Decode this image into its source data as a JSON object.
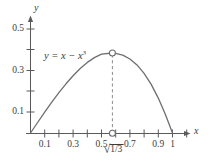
{
  "chart_data": {
    "type": "line",
    "title": "",
    "curve_label": "y = x − x³",
    "function": "y = x - x^3",
    "xlabel": "x",
    "ylabel": "y",
    "xlim": [
      -0.05,
      1.12
    ],
    "ylim": [
      -0.03,
      0.57
    ],
    "grid": false,
    "legend_position": "none",
    "x_ticks": [
      0.1,
      0.2,
      0.3,
      0.4,
      0.5,
      0.6,
      0.7,
      0.8,
      0.9,
      1.0,
      1.1
    ],
    "x_tick_labels": [
      {
        "value": 0.1,
        "label": "0.1"
      },
      {
        "value": 0.3,
        "label": "0.3"
      },
      {
        "value": 0.5,
        "label": "0.5"
      },
      {
        "value": 0.7,
        "label": "0.7"
      },
      {
        "value": 0.9,
        "label": "0.9"
      },
      {
        "value": 1.0,
        "label": "1"
      }
    ],
    "y_ticks": [
      0.1,
      0.2,
      0.3,
      0.4,
      0.5
    ],
    "y_tick_labels": [
      {
        "value": 0.1,
        "label": "0.1"
      },
      {
        "value": 0.3,
        "label": "0.3"
      },
      {
        "value": 0.5,
        "label": "0.5"
      }
    ],
    "x": [
      0.0,
      0.05,
      0.1,
      0.15,
      0.2,
      0.25,
      0.3,
      0.35,
      0.4,
      0.45,
      0.5,
      0.5774,
      0.6,
      0.65,
      0.7,
      0.75,
      0.8,
      0.85,
      0.9,
      0.95,
      1.0
    ],
    "y": [
      0.0,
      0.0499,
      0.099,
      0.1466,
      0.192,
      0.2344,
      0.273,
      0.3071,
      0.336,
      0.3589,
      0.375,
      0.3849,
      0.384,
      0.3754,
      0.357,
      0.3281,
      0.288,
      0.2359,
      0.171,
      0.0926,
      0.0
    ],
    "annotations": [
      {
        "name": "maximum-point",
        "x": 0.5774,
        "y": 0.3849,
        "marker": "open-circle",
        "label": "√1/3",
        "label_radicand": "1/3",
        "label_radical_sign": "√"
      },
      {
        "name": "x-axis-intercept-marker",
        "x": 0.5774,
        "y": 0.0,
        "marker": "open-circle"
      }
    ],
    "dashed_drop_line": {
      "x": 0.5774,
      "y_from": 0.0,
      "y_to": 0.3849
    }
  },
  "style": {
    "curve_color": "#6e6e6e",
    "axis_color": "#5a5a5a",
    "text_color": "#3c3c3c",
    "dash_color": "#8c8c8c",
    "marker_fill": "#ffffff",
    "background": "#ffffff"
  }
}
